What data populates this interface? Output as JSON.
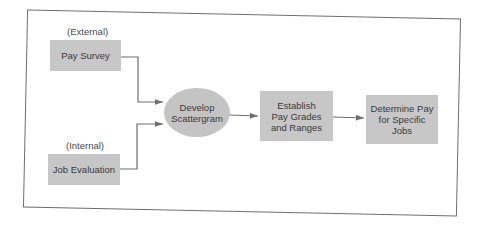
{
  "diagram": {
    "type": "flowchart",
    "title": "",
    "nodes": [
      {
        "id": "pay-survey",
        "label": "Pay Survey",
        "caption": "(External)",
        "shape": "rect"
      },
      {
        "id": "job-evaluation",
        "label": "Job Evaluation",
        "caption": "(Internal)",
        "shape": "rect"
      },
      {
        "id": "develop-scattergram",
        "label": "Develop\nScattergram",
        "shape": "ellipse"
      },
      {
        "id": "establish-pay-grades",
        "label": "Establish\nPay Grades\nand Ranges",
        "shape": "rect"
      },
      {
        "id": "determine-pay",
        "label": "Determine Pay\nfor Specific\nJobs",
        "shape": "rect"
      }
    ],
    "edges": [
      {
        "from": "pay-survey",
        "to": "develop-scattergram"
      },
      {
        "from": "job-evaluation",
        "to": "develop-scattergram"
      },
      {
        "from": "develop-scattergram",
        "to": "establish-pay-grades"
      },
      {
        "from": "establish-pay-grades",
        "to": "determine-pay"
      }
    ],
    "colors": {
      "node_fill": "#c7c7c7",
      "line": "#6e6e6e",
      "text": "#3a3a3a",
      "background": "#ffffff"
    }
  }
}
